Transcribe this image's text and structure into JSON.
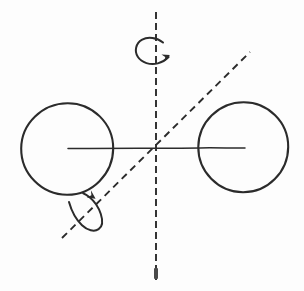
{
  "figure": {
    "title": "Rotation axes of a diatomic-like two-sphere model",
    "background_color": "#fdfdfd",
    "ink_color": "#2b2b2b",
    "width": 304,
    "height": 291
  },
  "spheres": [
    {
      "name": "left-sphere",
      "cx": 67,
      "cy": 149,
      "r": 46
    },
    {
      "name": "right-sphere",
      "cx": 243,
      "cy": 147,
      "r": 45
    }
  ],
  "bond": {
    "name": "bond-axis-line",
    "x1": 68,
    "y1": 148,
    "x2": 245,
    "y2": 148,
    "style": "solid"
  },
  "axes": [
    {
      "name": "vertical-rotation-axis",
      "orientation": "vertical",
      "x1": 156,
      "y1": 12,
      "x2": 156,
      "y2": 280,
      "style": "dashed",
      "dash_pattern": "7 4"
    },
    {
      "name": "diagonal-rotation-axis",
      "orientation": "diagonal",
      "x1": 62,
      "y1": 238,
      "x2": 250,
      "y2": 52,
      "style": "dashed",
      "dash_pattern": "7 5"
    }
  ],
  "intersection_point": {
    "name": "axes-intersection",
    "x": 155,
    "y": 148
  },
  "rotation_arrows": [
    {
      "name": "top-rotation-arrow",
      "about_axis": "vertical-rotation-axis",
      "shape": "open-c-curve-with-arrowhead",
      "position": {
        "x": 140,
        "y": 42
      },
      "direction": "clockwise-viewed-from-above"
    },
    {
      "name": "lower-left-rotation-arrow",
      "about_axis": "diagonal-rotation-axis",
      "shape": "loop-with-arrowhead",
      "position": {
        "x": 70,
        "y": 200
      },
      "direction": "about-diagonal-axis"
    }
  ],
  "scan_artifacts": [
    {
      "name": "bottom-scan-mark",
      "x": 154,
      "y": 268,
      "width": 4,
      "height": 11
    }
  ]
}
